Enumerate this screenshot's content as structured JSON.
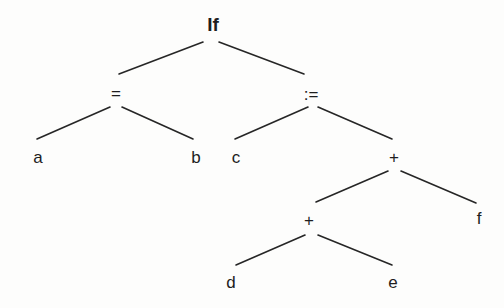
{
  "diagram": {
    "type": "abstract-syntax-tree",
    "nodes": [
      {
        "id": "if",
        "label": "If",
        "x": 213,
        "y": 24,
        "bold": true
      },
      {
        "id": "eq",
        "label": "=",
        "x": 116,
        "y": 93
      },
      {
        "id": "assign",
        "label": ":=",
        "x": 311,
        "y": 94
      },
      {
        "id": "a",
        "label": "a",
        "x": 38,
        "y": 157
      },
      {
        "id": "b",
        "label": "b",
        "x": 196,
        "y": 157
      },
      {
        "id": "c",
        "label": "c",
        "x": 236,
        "y": 157
      },
      {
        "id": "plus1",
        "label": "+",
        "x": 394,
        "y": 157
      },
      {
        "id": "plus2",
        "label": "+",
        "x": 309,
        "y": 220
      },
      {
        "id": "f",
        "label": "f",
        "x": 479,
        "y": 218
      },
      {
        "id": "d",
        "label": "d",
        "x": 231,
        "y": 282
      },
      {
        "id": "e",
        "label": "e",
        "x": 393,
        "y": 282
      }
    ],
    "edges": [
      {
        "from": "if",
        "to": "eq",
        "x1": 203,
        "y1": 42,
        "x2": 119,
        "y2": 74
      },
      {
        "from": "if",
        "to": "assign",
        "x1": 219,
        "y1": 42,
        "x2": 304,
        "y2": 74
      },
      {
        "from": "eq",
        "to": "a",
        "x1": 110,
        "y1": 107,
        "x2": 37,
        "y2": 139
      },
      {
        "from": "eq",
        "to": "b",
        "x1": 122,
        "y1": 107,
        "x2": 193,
        "y2": 139
      },
      {
        "from": "assign",
        "to": "c",
        "x1": 308,
        "y1": 107,
        "x2": 235,
        "y2": 139
      },
      {
        "from": "assign",
        "to": "plus1",
        "x1": 318,
        "y1": 107,
        "x2": 392,
        "y2": 139
      },
      {
        "from": "plus1",
        "to": "plus2",
        "x1": 388,
        "y1": 171,
        "x2": 316,
        "y2": 202
      },
      {
        "from": "plus1",
        "to": "f",
        "x1": 401,
        "y1": 171,
        "x2": 476,
        "y2": 203
      },
      {
        "from": "plus2",
        "to": "d",
        "x1": 305,
        "y1": 235,
        "x2": 236,
        "y2": 265
      },
      {
        "from": "plus2",
        "to": "e",
        "x1": 318,
        "y1": 235,
        "x2": 392,
        "y2": 265
      }
    ]
  },
  "colors": {
    "background": "#fdfdfc",
    "line": "#262626",
    "text": "#1e1e1e"
  }
}
